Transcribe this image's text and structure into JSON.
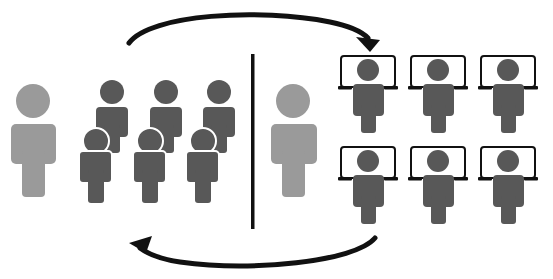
{
  "diagram": {
    "colors": {
      "background": "#ffffff",
      "leader_gray": "#9a9a9a",
      "member_dark": "#585858",
      "line_black": "#111111",
      "laptop_screen_fill": "#ffffff"
    },
    "left_group": {
      "leader": {
        "role": "leader",
        "color": "leader_gray"
      },
      "members_count": 6,
      "rows": 2
    },
    "divider": {
      "orientation": "vertical"
    },
    "right_group": {
      "leader": {
        "role": "leader",
        "color": "leader_gray"
      },
      "laptop_workers_count": 6,
      "rows": 2,
      "columns": 3
    },
    "arrows": [
      {
        "name": "top-arrow",
        "direction": "left-to-right",
        "icon": "curved-arrow-right"
      },
      {
        "name": "bottom-arrow",
        "direction": "right-to-left",
        "icon": "curved-arrow-left"
      }
    ]
  }
}
